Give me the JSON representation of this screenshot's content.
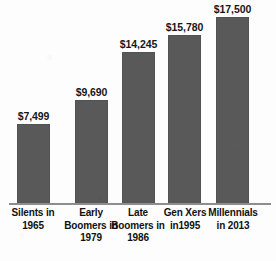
{
  "chart_data": {
    "type": "bar",
    "title": "",
    "subtitle": "",
    "xlabel": "",
    "ylabel": "",
    "grid": false,
    "legend": null,
    "ylim": [
      0,
      17500
    ],
    "categories": [
      "Silents in\n1965",
      "Early\nBoomers in\n1979",
      "Late\nBoomers in\n1986",
      "Gen Xers\nin1995",
      "Millennials\nin 2013"
    ],
    "values": [
      7499,
      9690,
      14245,
      15780,
      17500
    ],
    "value_labels": [
      "$7,499",
      "$9,690",
      "$14,245",
      "$15,780",
      "$17,500"
    ],
    "bar_color": "#595959",
    "axis_color": "#8d8d8d",
    "background_color": "#fdfdfd",
    "label_color": "#111111"
  },
  "bars": [
    {
      "category_line1": "Silents in",
      "category_line2": "1965",
      "category_line3": "",
      "value_label": "$7,499",
      "value": 7499
    },
    {
      "category_line1": "Early",
      "category_line2": "Boomers in",
      "category_line3": "1979",
      "value_label": "$9,690",
      "value": 9690
    },
    {
      "category_line1": "Late",
      "category_line2": "Boomers in",
      "category_line3": "1986",
      "value_label": "$14,245",
      "value": 14245
    },
    {
      "category_line1": "Gen Xers",
      "category_line2": "in1995",
      "category_line3": "",
      "value_label": "$15,780",
      "value": 15780
    },
    {
      "category_line1": "Millennials",
      "category_line2": "in 2013",
      "category_line3": "",
      "value_label": "$17,500",
      "value": 17500
    }
  ]
}
